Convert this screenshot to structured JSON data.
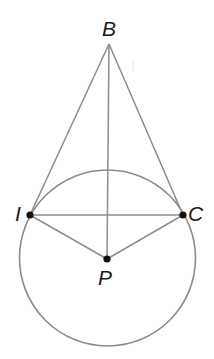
{
  "figure": {
    "type": "geometry-diagram",
    "colors": {
      "line": "#8c8c8c",
      "point": "#111111",
      "label": "#1a1a1a",
      "background": "#ffffff"
    },
    "circle": {
      "center": "P",
      "cx": 107.5,
      "cy": 258,
      "r": 88
    },
    "points": [
      {
        "id": "B",
        "label": "B",
        "x": 109,
        "y": 44,
        "dot": false,
        "label_x": 102,
        "label_y": 18
      },
      {
        "id": "I",
        "label": "I",
        "x": 30,
        "y": 215,
        "dot": true,
        "label_x": 14,
        "label_y": 204
      },
      {
        "id": "C",
        "label": "C",
        "x": 183,
        "y": 215,
        "dot": true,
        "label_x": 188,
        "label_y": 204
      },
      {
        "id": "P",
        "label": "P",
        "x": 107,
        "y": 259,
        "dot": true,
        "label_x": 98,
        "label_y": 268
      }
    ],
    "segments": [
      {
        "from": "B",
        "to": "I"
      },
      {
        "from": "B",
        "to": "C"
      },
      {
        "from": "B",
        "to": "P"
      },
      {
        "from": "I",
        "to": "C"
      },
      {
        "from": "I",
        "to": "P"
      },
      {
        "from": "C",
        "to": "P"
      }
    ]
  },
  "labels": {
    "B": "B",
    "I": "I",
    "C": "C",
    "P": "P"
  }
}
